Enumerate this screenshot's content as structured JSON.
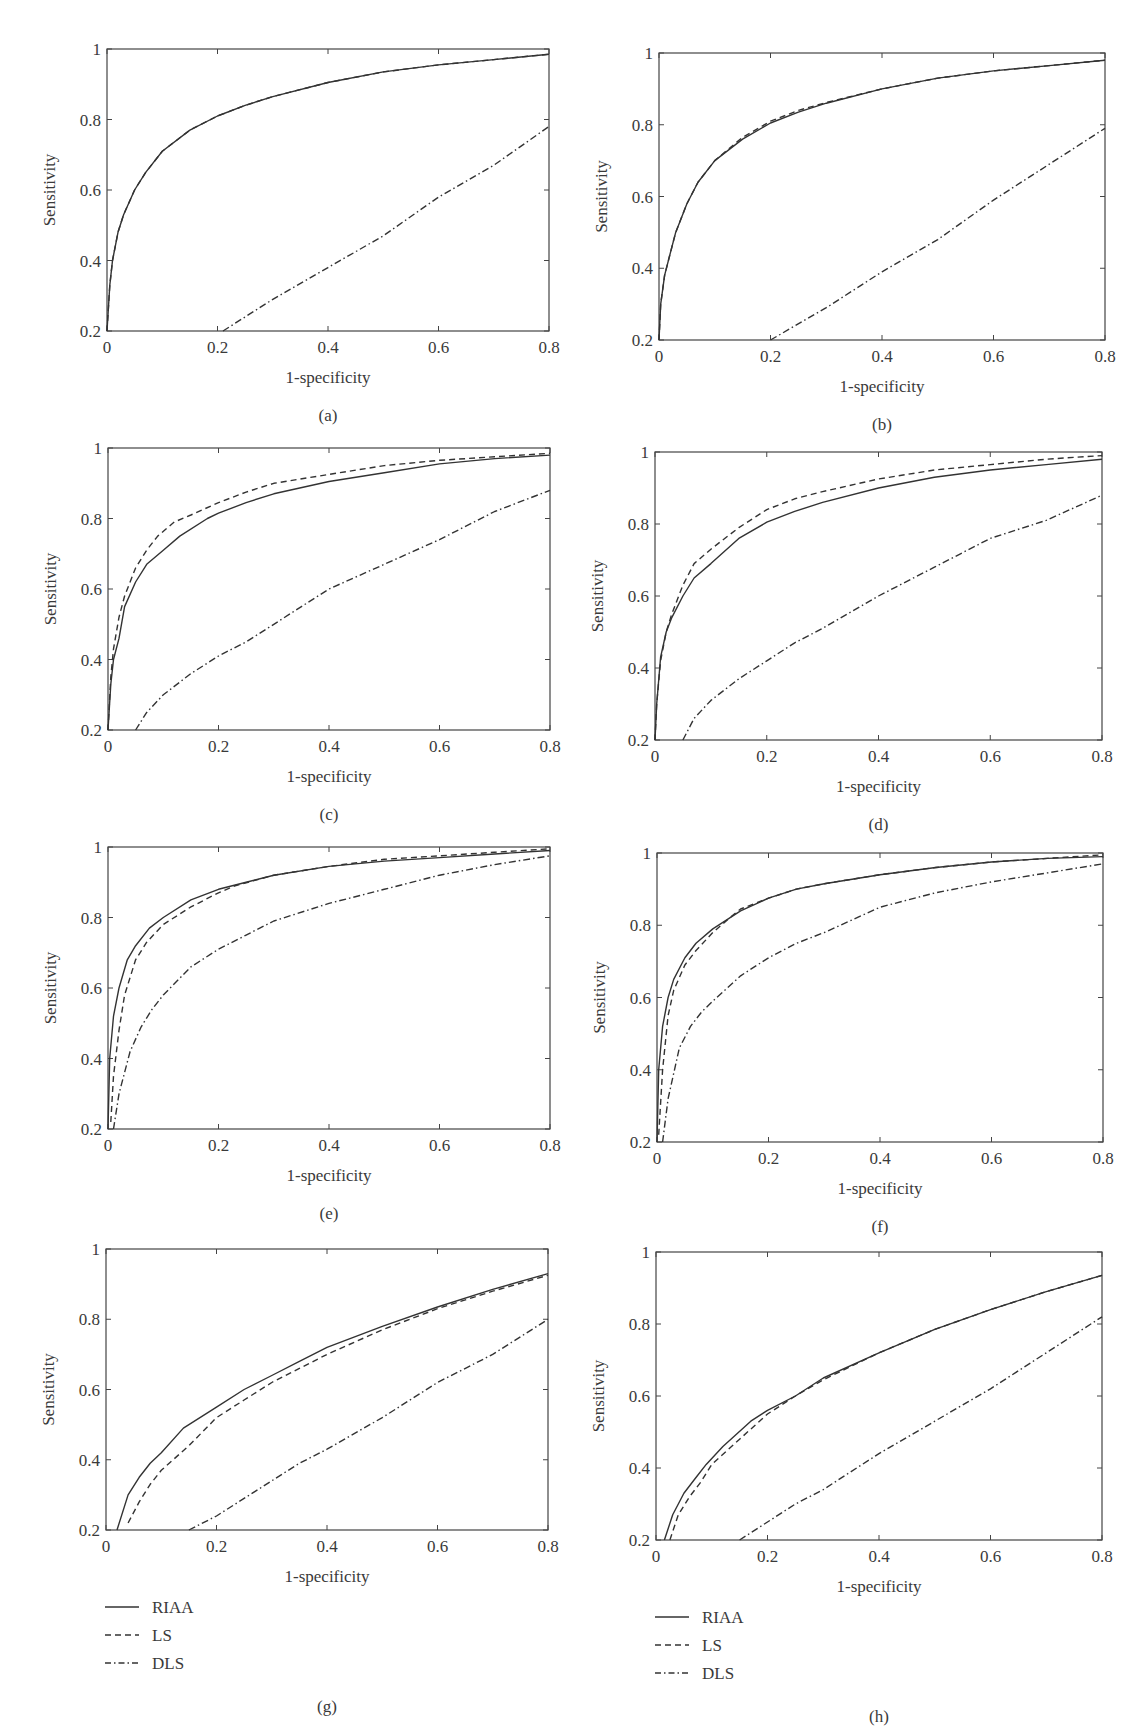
{
  "figure": {
    "legend": {
      "items": [
        {
          "label": "RIAA",
          "style": "solid"
        },
        {
          "label": "LS",
          "style": "dashed"
        },
        {
          "label": "DLS",
          "style": "dashdot"
        }
      ]
    },
    "axis_labels": {
      "x": "1-specificity",
      "y": "Sensitivity"
    },
    "x_ticks": [
      "0",
      "0.2",
      "0.4",
      "0.6",
      "0.8"
    ],
    "y_ticks": [
      "0.2",
      "0.4",
      "0.6",
      "0.8",
      "1"
    ],
    "line_color": "#333333"
  },
  "chart_data": [
    {
      "panel": "(a)",
      "type": "line",
      "title": "",
      "xlabel": "1-specificity",
      "ylabel": "Sensitivity",
      "xlim": [
        0,
        0.8
      ],
      "ylim": [
        0.2,
        1
      ],
      "grid": false,
      "legend": false,
      "frame": [
        107,
        49,
        549,
        331
      ],
      "series": [
        {
          "name": "RIAA",
          "x": [
            0,
            0.005,
            0.01,
            0.02,
            0.03,
            0.05,
            0.07,
            0.1,
            0.15,
            0.2,
            0.25,
            0.3,
            0.4,
            0.5,
            0.6,
            0.7,
            0.8
          ],
          "y": [
            0.2,
            0.33,
            0.4,
            0.48,
            0.53,
            0.6,
            0.65,
            0.71,
            0.77,
            0.81,
            0.84,
            0.865,
            0.905,
            0.935,
            0.955,
            0.97,
            0.985
          ]
        },
        {
          "name": "LS",
          "x": [
            0,
            0.005,
            0.01,
            0.02,
            0.03,
            0.05,
            0.07,
            0.1,
            0.15,
            0.2,
            0.25,
            0.3,
            0.4,
            0.5,
            0.6,
            0.7,
            0.8
          ],
          "y": [
            0.2,
            0.33,
            0.4,
            0.48,
            0.53,
            0.6,
            0.65,
            0.71,
            0.77,
            0.81,
            0.84,
            0.865,
            0.905,
            0.935,
            0.955,
            0.97,
            0.985
          ]
        },
        {
          "name": "DLS",
          "x": [
            0.21,
            0.3,
            0.4,
            0.5,
            0.6,
            0.7,
            0.8
          ],
          "y": [
            0.2,
            0.29,
            0.38,
            0.47,
            0.58,
            0.67,
            0.78
          ]
        }
      ]
    },
    {
      "panel": "(b)",
      "type": "line",
      "title": "",
      "xlabel": "1-specificity",
      "ylabel": "Sensitivity",
      "xlim": [
        0,
        0.8
      ],
      "ylim": [
        0.2,
        1
      ],
      "grid": false,
      "legend": false,
      "frame": [
        659,
        53,
        1105,
        340
      ],
      "series": [
        {
          "name": "RIAA",
          "x": [
            0,
            0.003,
            0.01,
            0.02,
            0.03,
            0.05,
            0.07,
            0.1,
            0.15,
            0.2,
            0.25,
            0.3,
            0.4,
            0.5,
            0.6,
            0.7,
            0.8
          ],
          "y": [
            0.2,
            0.3,
            0.38,
            0.44,
            0.5,
            0.58,
            0.64,
            0.7,
            0.76,
            0.805,
            0.835,
            0.86,
            0.9,
            0.93,
            0.95,
            0.965,
            0.98
          ]
        },
        {
          "name": "LS",
          "x": [
            0,
            0.003,
            0.01,
            0.02,
            0.03,
            0.05,
            0.07,
            0.1,
            0.15,
            0.2,
            0.25,
            0.3,
            0.4,
            0.5,
            0.6,
            0.7,
            0.8
          ],
          "y": [
            0.2,
            0.3,
            0.38,
            0.44,
            0.5,
            0.58,
            0.64,
            0.7,
            0.765,
            0.81,
            0.84,
            0.862,
            0.9,
            0.93,
            0.95,
            0.965,
            0.98
          ]
        },
        {
          "name": "DLS",
          "x": [
            0.2,
            0.3,
            0.4,
            0.5,
            0.6,
            0.7,
            0.8
          ],
          "y": [
            0.2,
            0.29,
            0.39,
            0.48,
            0.59,
            0.69,
            0.79
          ]
        }
      ]
    },
    {
      "panel": "(c)",
      "type": "line",
      "title": "",
      "xlabel": "1-specificity",
      "ylabel": "Sensitivity",
      "xlim": [
        0,
        0.8
      ],
      "ylim": [
        0.2,
        1
      ],
      "grid": false,
      "legend": false,
      "frame": [
        108,
        448,
        550,
        730
      ],
      "series": [
        {
          "name": "RIAA",
          "x": [
            0,
            0.005,
            0.01,
            0.02,
            0.03,
            0.05,
            0.07,
            0.1,
            0.13,
            0.18,
            0.2,
            0.25,
            0.3,
            0.4,
            0.5,
            0.6,
            0.7,
            0.8
          ],
          "y": [
            0.2,
            0.33,
            0.4,
            0.46,
            0.55,
            0.62,
            0.67,
            0.71,
            0.75,
            0.8,
            0.815,
            0.845,
            0.87,
            0.905,
            0.93,
            0.955,
            0.97,
            0.98
          ]
        },
        {
          "name": "LS",
          "x": [
            0,
            0.005,
            0.01,
            0.02,
            0.03,
            0.05,
            0.07,
            0.09,
            0.12,
            0.15,
            0.2,
            0.25,
            0.3,
            0.4,
            0.5,
            0.6,
            0.7,
            0.8
          ],
          "y": [
            0.2,
            0.35,
            0.43,
            0.52,
            0.58,
            0.66,
            0.71,
            0.75,
            0.79,
            0.81,
            0.845,
            0.875,
            0.9,
            0.925,
            0.95,
            0.965,
            0.975,
            0.985
          ]
        },
        {
          "name": "DLS",
          "x": [
            0.05,
            0.07,
            0.1,
            0.15,
            0.2,
            0.25,
            0.3,
            0.35,
            0.4,
            0.5,
            0.6,
            0.7,
            0.8
          ],
          "y": [
            0.2,
            0.25,
            0.3,
            0.36,
            0.41,
            0.45,
            0.5,
            0.55,
            0.6,
            0.67,
            0.74,
            0.82,
            0.88
          ]
        }
      ]
    },
    {
      "panel": "(d)",
      "type": "line",
      "title": "",
      "xlabel": "1-specificity",
      "ylabel": "Sensitivity",
      "xlim": [
        0,
        0.8
      ],
      "ylim": [
        0.2,
        1
      ],
      "grid": false,
      "legend": false,
      "frame": [
        655,
        452,
        1102,
        740
      ],
      "series": [
        {
          "name": "RIAA",
          "x": [
            0,
            0.003,
            0.01,
            0.02,
            0.03,
            0.05,
            0.07,
            0.1,
            0.15,
            0.2,
            0.25,
            0.3,
            0.4,
            0.5,
            0.6,
            0.7,
            0.8
          ],
          "y": [
            0.2,
            0.3,
            0.43,
            0.5,
            0.54,
            0.6,
            0.65,
            0.69,
            0.76,
            0.805,
            0.835,
            0.86,
            0.9,
            0.93,
            0.95,
            0.965,
            0.98
          ]
        },
        {
          "name": "LS",
          "x": [
            0,
            0.003,
            0.01,
            0.02,
            0.03,
            0.05,
            0.07,
            0.1,
            0.15,
            0.2,
            0.25,
            0.3,
            0.4,
            0.5,
            0.6,
            0.7,
            0.8
          ],
          "y": [
            0.2,
            0.3,
            0.42,
            0.5,
            0.55,
            0.63,
            0.69,
            0.73,
            0.79,
            0.84,
            0.87,
            0.89,
            0.925,
            0.95,
            0.965,
            0.98,
            0.99
          ]
        },
        {
          "name": "DLS",
          "x": [
            0.05,
            0.07,
            0.1,
            0.15,
            0.2,
            0.25,
            0.3,
            0.4,
            0.5,
            0.6,
            0.7,
            0.8
          ],
          "y": [
            0.2,
            0.26,
            0.31,
            0.37,
            0.42,
            0.47,
            0.51,
            0.6,
            0.68,
            0.76,
            0.81,
            0.88
          ]
        }
      ]
    },
    {
      "panel": "(e)",
      "type": "line",
      "title": "",
      "xlabel": "1-specificity",
      "ylabel": "Sensitivity",
      "xlim": [
        0,
        0.8
      ],
      "ylim": [
        0.2,
        1
      ],
      "grid": false,
      "legend": false,
      "frame": [
        108,
        847,
        550,
        1129
      ],
      "series": [
        {
          "name": "RIAA",
          "x": [
            0,
            0.003,
            0.01,
            0.02,
            0.035,
            0.05,
            0.075,
            0.1,
            0.15,
            0.2,
            0.25,
            0.3,
            0.4,
            0.5,
            0.6,
            0.7,
            0.8
          ],
          "y": [
            0.2,
            0.4,
            0.52,
            0.6,
            0.68,
            0.72,
            0.77,
            0.8,
            0.85,
            0.88,
            0.9,
            0.92,
            0.945,
            0.96,
            0.97,
            0.98,
            0.99
          ]
        },
        {
          "name": "LS",
          "x": [
            0.005,
            0.01,
            0.02,
            0.03,
            0.05,
            0.07,
            0.1,
            0.15,
            0.2,
            0.23,
            0.3,
            0.4,
            0.5,
            0.6,
            0.7,
            0.8
          ],
          "y": [
            0.22,
            0.35,
            0.48,
            0.58,
            0.68,
            0.73,
            0.78,
            0.83,
            0.87,
            0.89,
            0.92,
            0.945,
            0.965,
            0.975,
            0.985,
            0.995
          ]
        },
        {
          "name": "DLS",
          "x": [
            0.01,
            0.02,
            0.04,
            0.06,
            0.08,
            0.1,
            0.15,
            0.2,
            0.25,
            0.3,
            0.4,
            0.5,
            0.6,
            0.7,
            0.8
          ],
          "y": [
            0.2,
            0.3,
            0.42,
            0.49,
            0.54,
            0.58,
            0.66,
            0.71,
            0.75,
            0.79,
            0.84,
            0.88,
            0.92,
            0.95,
            0.975
          ]
        }
      ]
    },
    {
      "panel": "(f)",
      "type": "line",
      "title": "",
      "xlabel": "1-specificity",
      "ylabel": "Sensitivity",
      "xlim": [
        0,
        0.8
      ],
      "ylim": [
        0.2,
        1
      ],
      "grid": false,
      "legend": false,
      "frame": [
        657,
        853,
        1103,
        1142
      ],
      "series": [
        {
          "name": "RIAA",
          "x": [
            0,
            0.003,
            0.01,
            0.02,
            0.03,
            0.05,
            0.07,
            0.1,
            0.15,
            0.2,
            0.25,
            0.3,
            0.4,
            0.5,
            0.6,
            0.7,
            0.8
          ],
          "y": [
            0.2,
            0.4,
            0.52,
            0.6,
            0.65,
            0.71,
            0.75,
            0.79,
            0.84,
            0.875,
            0.9,
            0.915,
            0.94,
            0.96,
            0.975,
            0.985,
            0.99
          ]
        },
        {
          "name": "LS",
          "x": [
            0.003,
            0.01,
            0.02,
            0.03,
            0.05,
            0.07,
            0.1,
            0.13,
            0.15,
            0.2,
            0.25,
            0.3,
            0.4,
            0.5,
            0.6,
            0.7,
            0.8
          ],
          "y": [
            0.22,
            0.4,
            0.55,
            0.62,
            0.69,
            0.73,
            0.78,
            0.82,
            0.845,
            0.875,
            0.9,
            0.915,
            0.94,
            0.96,
            0.975,
            0.985,
            0.995
          ]
        },
        {
          "name": "DLS",
          "x": [
            0.01,
            0.02,
            0.04,
            0.06,
            0.08,
            0.1,
            0.15,
            0.2,
            0.25,
            0.3,
            0.4,
            0.5,
            0.6,
            0.7,
            0.8
          ],
          "y": [
            0.2,
            0.32,
            0.46,
            0.52,
            0.56,
            0.59,
            0.66,
            0.71,
            0.75,
            0.78,
            0.85,
            0.89,
            0.92,
            0.945,
            0.97
          ]
        }
      ]
    },
    {
      "panel": "(g)",
      "type": "line",
      "title": "",
      "xlabel": "1-specificity",
      "ylabel": "Sensitivity",
      "xlim": [
        0,
        0.8
      ],
      "ylim": [
        0.2,
        1
      ],
      "grid": false,
      "legend": true,
      "frame": [
        106,
        1249,
        548,
        1530
      ],
      "series": [
        {
          "name": "RIAA",
          "x": [
            0.02,
            0.04,
            0.06,
            0.08,
            0.1,
            0.14,
            0.2,
            0.25,
            0.3,
            0.35,
            0.4,
            0.5,
            0.6,
            0.7,
            0.8
          ],
          "y": [
            0.2,
            0.3,
            0.35,
            0.39,
            0.42,
            0.49,
            0.55,
            0.6,
            0.64,
            0.68,
            0.72,
            0.78,
            0.835,
            0.885,
            0.93
          ]
        },
        {
          "name": "LS",
          "x": [
            0.04,
            0.06,
            0.08,
            0.1,
            0.15,
            0.2,
            0.25,
            0.3,
            0.35,
            0.4,
            0.5,
            0.6,
            0.7,
            0.8
          ],
          "y": [
            0.22,
            0.28,
            0.33,
            0.37,
            0.44,
            0.52,
            0.57,
            0.62,
            0.66,
            0.7,
            0.77,
            0.83,
            0.88,
            0.925
          ]
        },
        {
          "name": "DLS",
          "x": [
            0.15,
            0.2,
            0.25,
            0.3,
            0.35,
            0.4,
            0.5,
            0.6,
            0.7,
            0.8
          ],
          "y": [
            0.2,
            0.24,
            0.29,
            0.34,
            0.39,
            0.43,
            0.52,
            0.62,
            0.7,
            0.8
          ]
        }
      ]
    },
    {
      "panel": "(h)",
      "type": "line",
      "title": "",
      "xlabel": "1-specificity",
      "ylabel": "Sensitivity",
      "xlim": [
        0,
        0.8
      ],
      "ylim": [
        0.2,
        1
      ],
      "grid": false,
      "legend": true,
      "frame": [
        656,
        1252,
        1102,
        1540
      ],
      "series": [
        {
          "name": "RIAA",
          "x": [
            0.015,
            0.03,
            0.05,
            0.07,
            0.09,
            0.12,
            0.17,
            0.2,
            0.25,
            0.3,
            0.4,
            0.5,
            0.6,
            0.7,
            0.8
          ],
          "y": [
            0.2,
            0.27,
            0.33,
            0.37,
            0.41,
            0.46,
            0.53,
            0.56,
            0.6,
            0.65,
            0.72,
            0.785,
            0.84,
            0.89,
            0.935
          ]
        },
        {
          "name": "LS",
          "x": [
            0.025,
            0.04,
            0.06,
            0.08,
            0.1,
            0.15,
            0.2,
            0.25,
            0.3,
            0.4,
            0.5,
            0.6,
            0.7,
            0.8
          ],
          "y": [
            0.2,
            0.27,
            0.32,
            0.36,
            0.41,
            0.48,
            0.55,
            0.6,
            0.645,
            0.72,
            0.785,
            0.84,
            0.89,
            0.935
          ]
        },
        {
          "name": "DLS",
          "x": [
            0.15,
            0.2,
            0.25,
            0.3,
            0.35,
            0.4,
            0.5,
            0.6,
            0.7,
            0.8
          ],
          "y": [
            0.2,
            0.25,
            0.3,
            0.34,
            0.39,
            0.44,
            0.53,
            0.62,
            0.72,
            0.82
          ]
        }
      ]
    }
  ]
}
